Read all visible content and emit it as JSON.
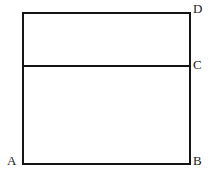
{
  "figure": {
    "kind": "geometry-diagram",
    "background_color": "#ffffff",
    "stroke_color": "#151515",
    "stroke_width": 2,
    "labels": {
      "a": "A",
      "b": "B",
      "c": "C",
      "d": "D"
    },
    "geometry": {
      "rectangle": {
        "left": 23,
        "right": 190,
        "top": 13,
        "bottom": 164,
        "width": 167,
        "height": 151
      },
      "divider": {
        "y": 66,
        "x_start": 23,
        "x_end": 190,
        "upper_band_height": 53,
        "lower_band_height": 98
      },
      "vertices": {
        "A": [
          23,
          164
        ],
        "B": [
          190,
          164
        ],
        "C": [
          190,
          66
        ],
        "D": [
          190,
          13
        ]
      }
    }
  }
}
